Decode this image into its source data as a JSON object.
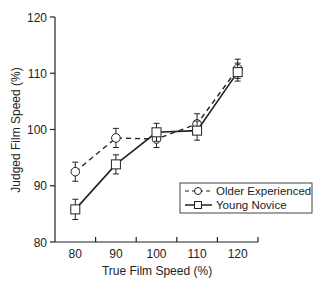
{
  "chart_data": {
    "type": "line",
    "title": "",
    "xlabel": "True Film Speed (%)",
    "ylabel": "Judged Film Speed (%)",
    "categories": [
      "80",
      "90",
      "100",
      "110",
      "120"
    ],
    "x": [
      80,
      90,
      100,
      110,
      120
    ],
    "ylim": [
      80,
      120
    ],
    "yticks": [
      80,
      90,
      100,
      110,
      120
    ],
    "grid": false,
    "legend_position": "lower right (inside)",
    "series": [
      {
        "name": "Older Experienced",
        "line_style": "dashed",
        "marker": "circle",
        "values": [
          92.5,
          98.5,
          98.3,
          101.0,
          110.8
        ],
        "error": [
          1.7,
          1.7,
          1.5,
          1.8,
          1.7
        ]
      },
      {
        "name": "Young Novice",
        "line_style": "solid",
        "marker": "square",
        "values": [
          85.8,
          93.8,
          99.5,
          99.8,
          110.2
        ],
        "error": [
          1.8,
          1.7,
          1.6,
          1.7,
          1.6
        ]
      }
    ]
  }
}
